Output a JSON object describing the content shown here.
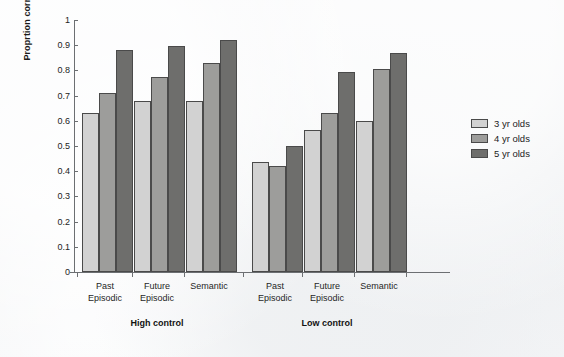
{
  "chart_data": {
    "type": "bar",
    "title": "",
    "xlabel": "",
    "ylabel": "Proprtion correct",
    "ylim": [
      0,
      1
    ],
    "ytick_step": 0.1,
    "yticks": [
      "1",
      "0.9",
      "0.8",
      "0.7",
      "0.6",
      "0.5",
      "0.4",
      "0.3",
      "0.2",
      "0.1",
      "0"
    ],
    "grid": false,
    "legend_position": "right",
    "panels": [
      "High control",
      "Low control"
    ],
    "categories": [
      "Past Episodic",
      "Future Episodic",
      "Semantic",
      "Past Episodic",
      "Future Episodic",
      "Semantic"
    ],
    "category_lines": [
      [
        "Past",
        "Episodic"
      ],
      [
        "Future",
        "Episodic"
      ],
      [
        "Semantic",
        ""
      ],
      [
        "Past",
        "Episodic"
      ],
      [
        "Future",
        "Episodic"
      ],
      [
        "Semantic",
        ""
      ]
    ],
    "series": [
      {
        "name": "3 yr olds",
        "color": "#d2d2d2",
        "values": [
          0.63,
          0.68,
          0.68,
          0.435,
          0.565,
          0.6
        ]
      },
      {
        "name": "4 yr olds",
        "color": "#9d9d9b",
        "values": [
          0.71,
          0.775,
          0.83,
          0.42,
          0.63,
          0.805
        ]
      },
      {
        "name": "5 yr olds",
        "color": "#6e6e6c",
        "values": [
          0.88,
          0.895,
          0.92,
          0.5,
          0.795,
          0.87
        ]
      }
    ]
  },
  "legend": {
    "items": [
      {
        "label": "3 yr olds"
      },
      {
        "label": "4 yr olds"
      },
      {
        "label": "5 yr olds"
      }
    ]
  },
  "colors": {
    "background": "#f2f3f5",
    "axis": "#6c6f72",
    "text": "#1b1b1b",
    "bar_outline": "#4a4a4a"
  }
}
